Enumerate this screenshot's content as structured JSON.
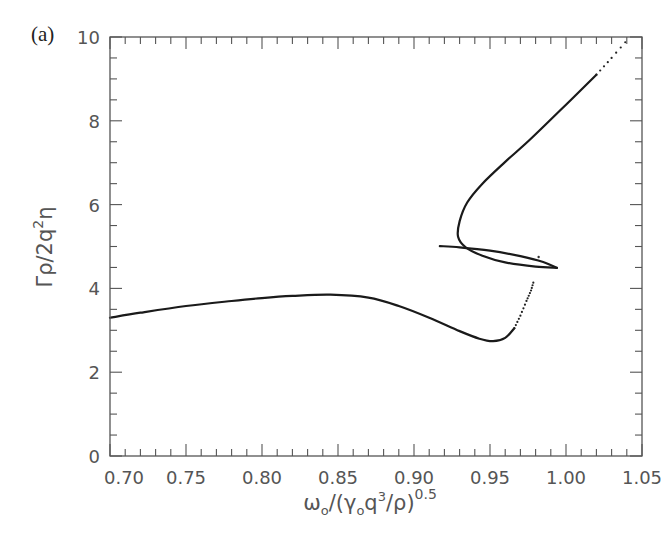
{
  "panel_label": "(a)",
  "chart_data": {
    "type": "line",
    "title": "",
    "xlabel": "ω₀/(γ₀q³/ρ)^0.5",
    "ylabel": "Γρ/2q²η",
    "xlim": [
      0.7,
      1.05
    ],
    "ylim": [
      0,
      10
    ],
    "xticks": [
      0.7,
      0.75,
      0.8,
      0.85,
      0.9,
      0.95,
      1.0,
      1.05
    ],
    "xtick_labels": [
      "0.70",
      "0.75",
      "0.80",
      "0.85",
      "0.90",
      "0.95",
      "1.00",
      "1.05"
    ],
    "x_minor_step": 0.01,
    "yticks": [
      0,
      2,
      4,
      6,
      8,
      10
    ],
    "ytick_labels": [
      "0",
      "2",
      "4",
      "6",
      "8",
      "10"
    ],
    "y_minor_step": 0.5,
    "grid": false,
    "legend": null,
    "series": [
      {
        "name": "lower branch",
        "style": "solid",
        "x": [
          0.7,
          0.72,
          0.75,
          0.78,
          0.8,
          0.82,
          0.845,
          0.87,
          0.89,
          0.91,
          0.93,
          0.943,
          0.952,
          0.96,
          0.966
        ],
        "y": [
          3.3,
          3.42,
          3.58,
          3.7,
          3.77,
          3.82,
          3.85,
          3.78,
          3.58,
          3.3,
          2.98,
          2.8,
          2.74,
          2.82,
          3.05
        ]
      },
      {
        "name": "lower branch (sparse)",
        "style": "dotted",
        "x": [
          0.966,
          0.97,
          0.974,
          0.977,
          0.979
        ],
        "y": [
          3.05,
          3.35,
          3.7,
          3.95,
          4.2
        ]
      },
      {
        "name": "loop upper edge",
        "style": "solid",
        "x": [
          0.917,
          0.93,
          0.95,
          0.97,
          0.985,
          0.994
        ],
        "y": [
          5.01,
          4.98,
          4.9,
          4.77,
          4.63,
          4.49
        ]
      },
      {
        "name": "loop lower edge and upper branch",
        "style": "solid",
        "x": [
          0.994,
          0.98,
          0.96,
          0.945,
          0.934,
          0.929,
          0.93,
          0.935,
          0.945,
          0.96,
          0.976,
          1.001,
          1.02
        ],
        "y": [
          4.49,
          4.52,
          4.62,
          4.78,
          4.98,
          5.23,
          5.6,
          6.05,
          6.5,
          7.02,
          7.54,
          8.42,
          9.1
        ]
      },
      {
        "name": "upper branch (sparse)",
        "style": "dotted",
        "x": [
          1.02,
          1.03,
          1.042
        ],
        "y": [
          9.1,
          9.5,
          10.0
        ]
      }
    ],
    "annotations": [
      {
        "type": "stray-point",
        "x": 0.982,
        "y": 4.75
      }
    ]
  }
}
